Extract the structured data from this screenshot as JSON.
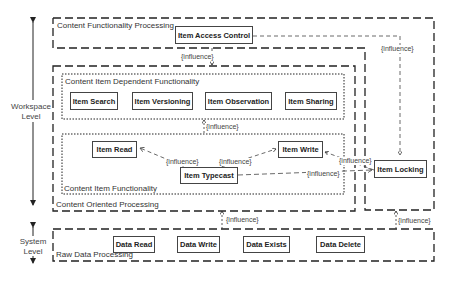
{
  "levels": {
    "workspace": "Workspace\nLevel",
    "workspace_line1": "Workspace",
    "workspace_line2": "Level",
    "system_line1": "System",
    "system_line2": "Level"
  },
  "containers": {
    "content_functionality_processing": "Content Functionality Processing",
    "content_item_dependent_functionality": "Content Item Dependent Functionality",
    "content_item_functionality": "Content Item Functionality",
    "content_oriented_processing": "Content Oriented Processing",
    "raw_data_processing": "Raw Data Processing"
  },
  "nodes": {
    "item_access_control": "Item Access Control",
    "item_search": "Item Search",
    "item_versioning": "Item Versioning",
    "item_observation": "Item Observation",
    "item_sharing": "Item Sharing",
    "item_read": "Item Read",
    "item_write": "Item Write",
    "item_typecast": "Item Typecast",
    "item_locking": "Item Locking",
    "data_read": "Data Read",
    "data_write": "Data Write",
    "data_exists": "Data Exists",
    "data_delete": "Data Delete"
  },
  "edges": {
    "influence": "{influence}"
  }
}
